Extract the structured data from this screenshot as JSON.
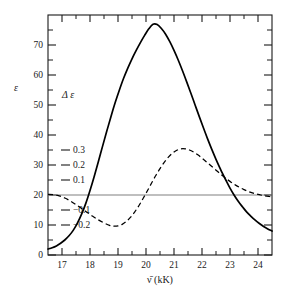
{
  "chart_data": {
    "type": "line",
    "title": "",
    "xlabel": "ν̄ (kK)",
    "ylabel": "ε",
    "secondary_ylabel": "Δ ε",
    "xlim": [
      16.5,
      24.5
    ],
    "ylim": [
      0,
      80
    ],
    "secondary_ylim": [
      -0.4,
      0.6
    ],
    "grid": false,
    "legend": false,
    "x_ticks": [
      17,
      18,
      19,
      20,
      21,
      22,
      23,
      24
    ],
    "x_tick_labels": [
      "17",
      "18",
      "19",
      "20",
      "21",
      "22",
      "23",
      "24"
    ],
    "x_minor_ticks": [
      16.5,
      17.5,
      18.5,
      19.5,
      20.5,
      21.5,
      22.5,
      23.5,
      24.5
    ],
    "y_ticks": [
      0,
      10,
      20,
      30,
      40,
      50,
      60,
      70
    ],
    "y_tick_labels": [
      "0",
      "10",
      "20",
      "30",
      "40",
      "50",
      "60",
      "70"
    ],
    "y_minor_ticks": [
      5,
      15,
      25,
      35,
      45,
      55,
      65,
      75
    ],
    "delta_ticks": [
      0.3,
      0.2,
      0.1,
      -0.1,
      -0.2
    ],
    "delta_tick_labels": [
      "0.3",
      "0.2",
      "0.1",
      "−0.1",
      "−0.2"
    ],
    "delta_zero_epsilon": 20,
    "delta_scale_epsilon_per_unit": 50,
    "zero_line": {
      "name": "delta-epsilon-zero-line",
      "epsilon_value": 20,
      "color": "#808080",
      "style": "solid"
    },
    "series": [
      {
        "name": "absorption",
        "label": "ε",
        "style": "solid",
        "color": "#000000",
        "axis": "left",
        "peak_x": 20.2,
        "peak_y": 77,
        "points": [
          [
            16.5,
            2.0
          ],
          [
            16.65,
            2.4
          ],
          [
            16.8,
            3.0
          ],
          [
            16.95,
            3.9
          ],
          [
            17.1,
            5.0
          ],
          [
            17.25,
            6.4
          ],
          [
            17.4,
            8.2
          ],
          [
            17.55,
            10.6
          ],
          [
            17.7,
            13.6
          ],
          [
            17.85,
            17.2
          ],
          [
            18.0,
            21.5
          ],
          [
            18.15,
            26.2
          ],
          [
            18.3,
            31.2
          ],
          [
            18.45,
            36.3
          ],
          [
            18.6,
            41.3
          ],
          [
            18.75,
            46.2
          ],
          [
            18.9,
            50.8
          ],
          [
            19.05,
            55.0
          ],
          [
            19.2,
            58.9
          ],
          [
            19.35,
            62.3
          ],
          [
            19.5,
            65.4
          ],
          [
            19.65,
            68.2
          ],
          [
            19.8,
            70.8
          ],
          [
            19.95,
            73.2
          ],
          [
            20.1,
            75.4
          ],
          [
            20.25,
            76.9
          ],
          [
            20.4,
            76.8
          ],
          [
            20.55,
            75.5
          ],
          [
            20.7,
            73.6
          ],
          [
            20.85,
            71.1
          ],
          [
            21.0,
            68.2
          ],
          [
            21.15,
            65.0
          ],
          [
            21.3,
            61.5
          ],
          [
            21.45,
            57.8
          ],
          [
            21.6,
            54.0
          ],
          [
            21.75,
            50.1
          ],
          [
            21.9,
            46.2
          ],
          [
            22.05,
            42.4
          ],
          [
            22.2,
            38.7
          ],
          [
            22.35,
            35.2
          ],
          [
            22.5,
            31.9
          ],
          [
            22.65,
            28.8
          ],
          [
            22.7,
            27.8
          ],
          [
            22.85,
            25.0
          ],
          [
            23.0,
            22.3
          ],
          [
            23.15,
            19.9
          ],
          [
            23.3,
            17.8
          ],
          [
            23.45,
            16.0
          ],
          [
            23.6,
            14.3
          ],
          [
            23.75,
            12.9
          ],
          [
            23.9,
            11.6
          ],
          [
            24.05,
            10.5
          ],
          [
            24.2,
            9.5
          ],
          [
            24.35,
            8.7
          ],
          [
            24.5,
            8.0
          ]
        ]
      },
      {
        "name": "circular-dichroism",
        "label": "Δ ε",
        "style": "dashed",
        "color": "#000000",
        "axis": "right",
        "min_x": 18.8,
        "min_delta_epsilon": -0.21,
        "max_x": 21.3,
        "max_delta_epsilon": 0.31,
        "points": [
          [
            16.5,
            20.2
          ],
          [
            16.7,
            20.1
          ],
          [
            16.9,
            19.7
          ],
          [
            17.1,
            19.0
          ],
          [
            17.3,
            18.0
          ],
          [
            17.5,
            16.8
          ],
          [
            17.7,
            15.5
          ],
          [
            17.9,
            14.2
          ],
          [
            18.1,
            12.9
          ],
          [
            18.3,
            11.7
          ],
          [
            18.5,
            10.7
          ],
          [
            18.7,
            9.9
          ],
          [
            18.85,
            9.6
          ],
          [
            19.0,
            9.7
          ],
          [
            19.15,
            10.2
          ],
          [
            19.3,
            11.2
          ],
          [
            19.45,
            12.6
          ],
          [
            19.6,
            14.4
          ],
          [
            19.75,
            16.5
          ],
          [
            19.9,
            18.9
          ],
          [
            20.05,
            21.4
          ],
          [
            20.2,
            24.0
          ],
          [
            20.35,
            26.5
          ],
          [
            20.5,
            28.8
          ],
          [
            20.65,
            30.9
          ],
          [
            20.8,
            32.6
          ],
          [
            20.95,
            34.0
          ],
          [
            21.1,
            34.9
          ],
          [
            21.25,
            35.4
          ],
          [
            21.4,
            35.4
          ],
          [
            21.55,
            35.0
          ],
          [
            21.7,
            34.3
          ],
          [
            21.85,
            33.4
          ],
          [
            22.0,
            32.3
          ],
          [
            22.15,
            31.1
          ],
          [
            22.3,
            29.9
          ],
          [
            22.45,
            28.7
          ],
          [
            22.6,
            27.5
          ],
          [
            22.75,
            26.3
          ],
          [
            22.9,
            25.2
          ],
          [
            23.05,
            24.2
          ],
          [
            23.2,
            23.3
          ],
          [
            23.35,
            22.5
          ],
          [
            23.5,
            21.8
          ],
          [
            23.65,
            21.2
          ],
          [
            23.8,
            20.7
          ],
          [
            23.95,
            20.3
          ],
          [
            24.1,
            20.0
          ],
          [
            24.25,
            19.7
          ],
          [
            24.4,
            19.5
          ],
          [
            24.5,
            19.4
          ]
        ]
      }
    ]
  }
}
